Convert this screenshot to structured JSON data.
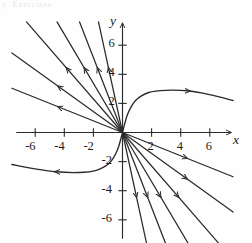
{
  "figure": {
    "header_text": "y. Exercises",
    "axis_x_label": "x",
    "axis_y_label": "y",
    "stroke_color": "#2b2b2b",
    "background": "#fefefe"
  },
  "chart_data": {
    "type": "line",
    "title": "",
    "subtitle": "",
    "xlabel": "x",
    "ylabel": "y",
    "xlim": [
      -7.6,
      7.6
    ],
    "ylim": [
      -7.6,
      7.6
    ],
    "grid": false,
    "legend": "none",
    "axis_arrows": [
      "x-positive",
      "y-positive"
    ],
    "xticks": [
      -6,
      -4,
      -2,
      2,
      4,
      6
    ],
    "yticks": [
      -6,
      -4,
      -2,
      2,
      4,
      6
    ],
    "xtick_labels": [
      "-6",
      "-4",
      "-2",
      "2",
      "4",
      "6"
    ],
    "ytick_labels": [
      "-6",
      "-4",
      "-2",
      "2",
      "4",
      "6"
    ],
    "series": [
      {
        "name": "ray-1",
        "kind": "ray",
        "slope": -0.4,
        "arrow": "outward",
        "values": [
          [
            -7.6,
            3.04
          ],
          [
            0,
            0
          ]
        ]
      },
      {
        "name": "ray-2",
        "kind": "ray",
        "slope": -0.72,
        "arrow": "outward",
        "values": [
          [
            -7.6,
            5.47
          ],
          [
            0,
            0
          ]
        ]
      },
      {
        "name": "ray-3",
        "kind": "ray",
        "slope": -1.15,
        "arrow": "outward",
        "values": [
          [
            -6.6,
            7.6
          ],
          [
            0,
            0
          ]
        ]
      },
      {
        "name": "ray-4",
        "kind": "ray",
        "slope": -1.7,
        "arrow": "outward",
        "values": [
          [
            -4.5,
            7.6
          ],
          [
            0,
            0
          ]
        ]
      },
      {
        "name": "ray-5",
        "kind": "ray",
        "slope": -2.6,
        "arrow": "outward",
        "values": [
          [
            -2.95,
            7.6
          ],
          [
            0,
            0
          ]
        ]
      },
      {
        "name": "ray-6",
        "kind": "ray",
        "slope": -4.6,
        "arrow": "outward",
        "values": [
          [
            -1.65,
            7.6
          ],
          [
            0,
            0
          ]
        ]
      },
      {
        "name": "ray-7",
        "kind": "ray",
        "slope": -0.4,
        "arrow": "outward",
        "values": [
          [
            0,
            0
          ],
          [
            7.6,
            -3.04
          ]
        ]
      },
      {
        "name": "ray-8",
        "kind": "ray",
        "slope": -0.72,
        "arrow": "outward",
        "values": [
          [
            0,
            0
          ],
          [
            7.6,
            -5.47
          ]
        ]
      },
      {
        "name": "ray-9",
        "kind": "ray",
        "slope": -1.15,
        "arrow": "outward",
        "values": [
          [
            0,
            0
          ],
          [
            6.6,
            -7.6
          ]
        ]
      },
      {
        "name": "ray-10",
        "kind": "ray",
        "slope": -1.7,
        "arrow": "outward",
        "values": [
          [
            0,
            0
          ],
          [
            4.5,
            -7.6
          ]
        ]
      },
      {
        "name": "ray-11",
        "kind": "ray",
        "slope": -2.6,
        "arrow": "outward",
        "values": [
          [
            0,
            0
          ],
          [
            2.95,
            -7.6
          ]
        ]
      },
      {
        "name": "ray-12",
        "kind": "ray",
        "slope": -4.6,
        "arrow": "outward",
        "values": [
          [
            0,
            0
          ],
          [
            1.65,
            -7.6
          ]
        ]
      },
      {
        "name": "separatrix-right",
        "kind": "curve",
        "arrow": "rightward",
        "values": [
          [
            0,
            0
          ],
          [
            0.35,
            1.25
          ],
          [
            0.9,
            2.2
          ],
          [
            1.8,
            2.75
          ],
          [
            3.0,
            2.9
          ],
          [
            4.6,
            2.85
          ],
          [
            6.0,
            2.6
          ],
          [
            7.6,
            2.2
          ]
        ]
      },
      {
        "name": "separatrix-left",
        "kind": "curve",
        "arrow": "leftward",
        "values": [
          [
            0,
            0
          ],
          [
            -0.35,
            -1.2
          ],
          [
            -0.9,
            -2.1
          ],
          [
            -1.8,
            -2.6
          ],
          [
            -3.0,
            -2.75
          ],
          [
            -4.6,
            -2.7
          ],
          [
            -6.0,
            -2.5
          ],
          [
            -7.6,
            -2.2
          ]
        ]
      }
    ]
  }
}
